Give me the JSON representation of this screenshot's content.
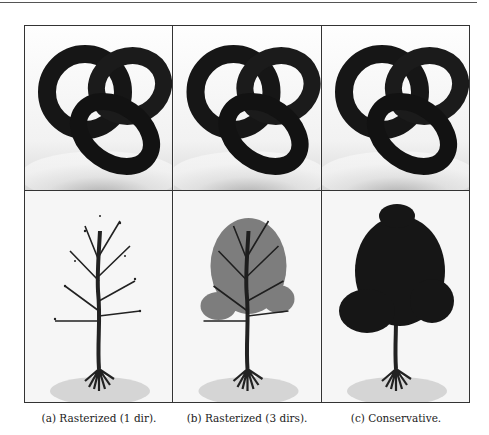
{
  "figure": {
    "columns": [
      {
        "id": "a",
        "caption": "(a) Rasterized (1 dir).",
        "method": "rasterized-1-dir"
      },
      {
        "id": "b",
        "caption": "(b) Rasterized (3 dirs).",
        "method": "rasterized-3-dirs"
      },
      {
        "id": "c",
        "caption": "(c) Conservative.",
        "method": "conservative"
      }
    ],
    "rows": [
      {
        "id": "knot",
        "subject": "torus-knot-render"
      },
      {
        "id": "tree",
        "subject": "tree-render"
      }
    ]
  }
}
